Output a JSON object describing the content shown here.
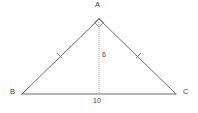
{
  "figure": {
    "kind": "isosceles-right-triangle-with-altitude",
    "background_color": "#ffffff",
    "stroke_color": "#555555",
    "text_color": "#3a3a3a",
    "altitude_color": "#9a9a9a",
    "vertices": {
      "apex": {
        "name": "A",
        "x": 99,
        "y": 19
      },
      "left": {
        "name": "B",
        "x": 22,
        "y": 94
      },
      "right": {
        "name": "C",
        "x": 176,
        "y": 94
      }
    },
    "labels": {
      "apex": "A",
      "left": "B",
      "right": "C",
      "altitude": "6",
      "base": "10"
    },
    "marks": {
      "right_angle_at": "A",
      "right_angle_marker": "square-rotated",
      "congruent_sides": [
        "AB",
        "AC"
      ],
      "tick_count": 1,
      "altitude_style": "dotted"
    }
  }
}
